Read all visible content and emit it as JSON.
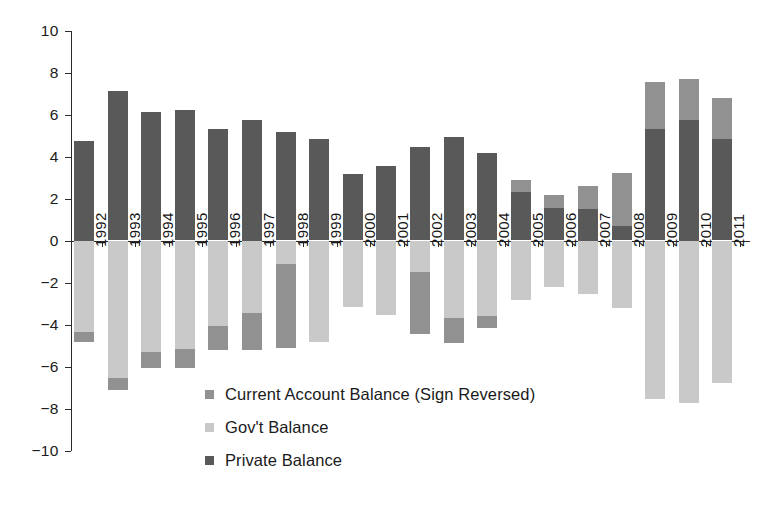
{
  "chart_data": {
    "type": "bar",
    "stacked": true,
    "title": "",
    "subtitle": "",
    "xlabel": "",
    "ylabel": "",
    "ylim": [
      -10,
      10
    ],
    "ytick_step": 2,
    "grid": false,
    "legend_position": "inside-bottom-center",
    "categories": [
      "1992",
      "1993",
      "1994",
      "1995",
      "1996",
      "1997",
      "1998",
      "1999",
      "2000",
      "2001",
      "2002",
      "2003",
      "2004",
      "2005",
      "2006",
      "2007",
      "2008",
      "2009",
      "2010",
      "2011"
    ],
    "ytick_labels": [
      "10",
      "8",
      "6",
      "4",
      "2",
      "0",
      "−2",
      "−4",
      "−6",
      "−8",
      "−10"
    ],
    "ytick_values": [
      10,
      8,
      6,
      4,
      2,
      0,
      -2,
      -4,
      -6,
      -8,
      -10
    ],
    "series": [
      {
        "name": "Private Balance",
        "color": "#595959",
        "values": [
          4.75,
          7.1,
          6.1,
          6.2,
          5.3,
          5.75,
          5.15,
          4.85,
          3.15,
          3.55,
          4.45,
          4.95,
          4.15,
          2.3,
          1.55,
          1.5,
          0.7,
          5.3,
          5.75,
          4.85
        ]
      },
      {
        "name": "Gov't Balance",
        "color": "#c9c9c9",
        "values": [
          -4.35,
          -6.55,
          -5.3,
          -5.15,
          -4.05,
          -3.45,
          -1.1,
          0.0,
          0.0,
          0.0,
          -1.5,
          -3.7,
          -3.6,
          0.6,
          0.6,
          1.1,
          2.5,
          2.25,
          1.95,
          1.95
        ]
      },
      {
        "name": "Current Account Balance (Sign Reversed)",
        "color": "#919191",
        "values": [
          -0.5,
          -0.55,
          -0.75,
          -0.9,
          -1.15,
          -1.75,
          -4.0,
          -4.85,
          -3.15,
          -3.55,
          -2.95,
          -1.2,
          -0.55,
          -2.85,
          -2.2,
          -2.55,
          -3.2,
          -7.55,
          -7.75,
          -6.8
        ]
      }
    ],
    "notes": {
      "segment_order_positive": [
        "Private Balance",
        "Gov't Balance"
      ],
      "segment_order_negative": [
        "Gov't Balance",
        "Current Account Balance (Sign Reversed)"
      ]
    }
  },
  "legend": {
    "items": [
      {
        "label": "Current Account Balance (Sign Reversed)",
        "swatch": "legend-swatch-current-account"
      },
      {
        "label": "Gov't Balance",
        "swatch": "legend-swatch-gov"
      },
      {
        "label": "Private Balance",
        "swatch": "legend-swatch-private"
      }
    ]
  },
  "colors": {
    "private": "#595959",
    "gov": "#c9c9c9",
    "current_account": "#919191",
    "axis": "#2b2b2b",
    "background": "#ffffff"
  }
}
